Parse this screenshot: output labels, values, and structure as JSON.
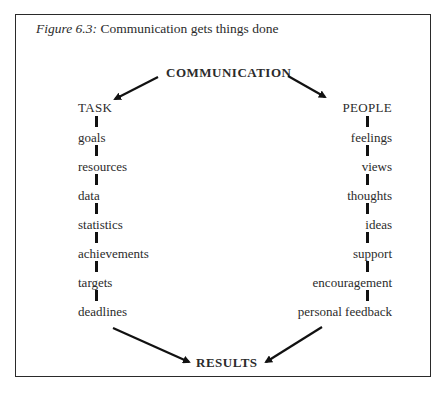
{
  "figure": {
    "label": "Figure 6.3:",
    "caption": "Communication gets things done"
  },
  "diagram": {
    "source": "COMMUNICATION",
    "left_branch": {
      "heading": "TASK",
      "items": [
        "goals",
        "resources",
        "data",
        "statistics",
        "achievements",
        "targets",
        "deadlines"
      ]
    },
    "right_branch": {
      "heading": "PEOPLE",
      "items": [
        "feelings",
        "views",
        "thoughts",
        "ideas",
        "support",
        "encouragement",
        "personal feedback"
      ]
    },
    "outcome": "RESULTS",
    "arrows": [
      {
        "from": "COMMUNICATION",
        "to": "TASK"
      },
      {
        "from": "COMMUNICATION",
        "to": "PEOPLE"
      },
      {
        "from": "deadlines",
        "to": "RESULTS"
      },
      {
        "from": "personal feedback",
        "to": "RESULTS"
      }
    ],
    "colors": {
      "line": "#111111",
      "text": "#2b2b2b",
      "frame": "#2a2a2a"
    }
  }
}
